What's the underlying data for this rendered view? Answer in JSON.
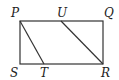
{
  "diagram": {
    "type": "geometry",
    "points": {
      "P": {
        "label": "P",
        "x": 20,
        "y": 21
      },
      "U": {
        "label": "U",
        "x": 61,
        "y": 21
      },
      "Q": {
        "label": "Q",
        "x": 103,
        "y": 21
      },
      "S": {
        "label": "S",
        "x": 20,
        "y": 64
      },
      "T": {
        "label": "T",
        "x": 44,
        "y": 64
      },
      "R": {
        "label": "R",
        "x": 103,
        "y": 64
      }
    },
    "segments": [
      [
        "P",
        "Q"
      ],
      [
        "Q",
        "R"
      ],
      [
        "R",
        "S"
      ],
      [
        "S",
        "P"
      ],
      [
        "P",
        "T"
      ],
      [
        "U",
        "R"
      ]
    ],
    "stroke_color": "#333333"
  }
}
